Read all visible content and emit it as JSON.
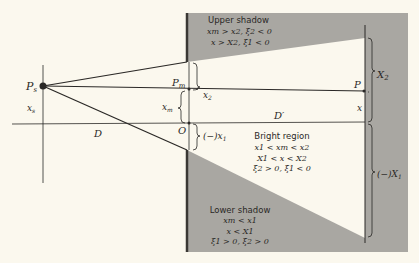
{
  "colors": {
    "background": "#fbf8ee",
    "shadow": "#a9a7a2",
    "bright": "#fbf8ee",
    "line": "#2a2826",
    "screen_edge": "#3a3834"
  },
  "labels": {
    "source": "P",
    "source_sub": "s",
    "source_height": "x",
    "source_height_sub": "s",
    "distance_D": "D",
    "distance_Dprime": "D′",
    "point_Pm": "P",
    "point_Pm_sub": "m",
    "point_O": "O",
    "xm": "x",
    "xm_sub": "m",
    "x2": "x",
    "x2_sub": "2",
    "x1_prefix": "(−)",
    "x1": "x",
    "x1_sub": "1",
    "point_P": "P",
    "x": "x",
    "X2": "X",
    "X2_sub": "2",
    "X1_prefix": "(−)",
    "X1": "X",
    "X1_sub": "1"
  },
  "regions": {
    "upper_shadow": {
      "title": "Upper shadow",
      "line1": "xm > x2, ξ2 < 0",
      "line2": "x > X2, ξ1 < 0"
    },
    "bright": {
      "title": "Bright region",
      "line1": "x1 < xm < x2",
      "line2": "X1 < x < X2",
      "line3": "ξ2 > 0, ξ1 < 0"
    },
    "lower_shadow": {
      "title": "Lower shadow",
      "line1": "xm < x1",
      "line2": "x < X1",
      "line3": "ξ1 > 0, ξ2 > 0"
    }
  }
}
